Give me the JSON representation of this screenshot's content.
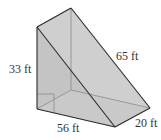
{
  "figure": {
    "type": "triangular-prism",
    "fill_color": "#c8c8c8",
    "edge_color": "#2a2a2a",
    "hidden_edge_color": "#8a8a8a",
    "labels": {
      "height": "33 ft",
      "hypotenuse": "65 ft",
      "base": "56 ft",
      "depth": "20 ft"
    }
  }
}
